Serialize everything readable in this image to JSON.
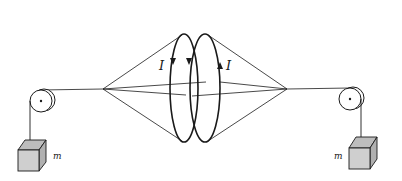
{
  "diagram": {
    "labels": {
      "current_left": "I",
      "current_right": "I",
      "mass_left": "m",
      "mass_right": "m"
    },
    "colors": {
      "line": "#1a1a1a",
      "block_fill": "#cfcfcf",
      "block_top": "#bdbdbd",
      "background": "#ffffff"
    },
    "elements": {
      "left_pulley": {
        "cx": 41,
        "cy": 101,
        "r": 11
      },
      "right_pulley": {
        "cx": 350,
        "cy": 99,
        "r": 11
      },
      "left_coil": {
        "cx": 184,
        "cy": 88,
        "rx": 14,
        "ry": 54,
        "arrow": "down"
      },
      "right_coil": {
        "cx": 205,
        "cy": 88,
        "rx": 15,
        "ry": 54,
        "arrows": [
          "down",
          "up"
        ]
      },
      "left_apex": {
        "x": 103,
        "y": 89
      },
      "right_apex": {
        "x": 287,
        "y": 89
      }
    }
  }
}
